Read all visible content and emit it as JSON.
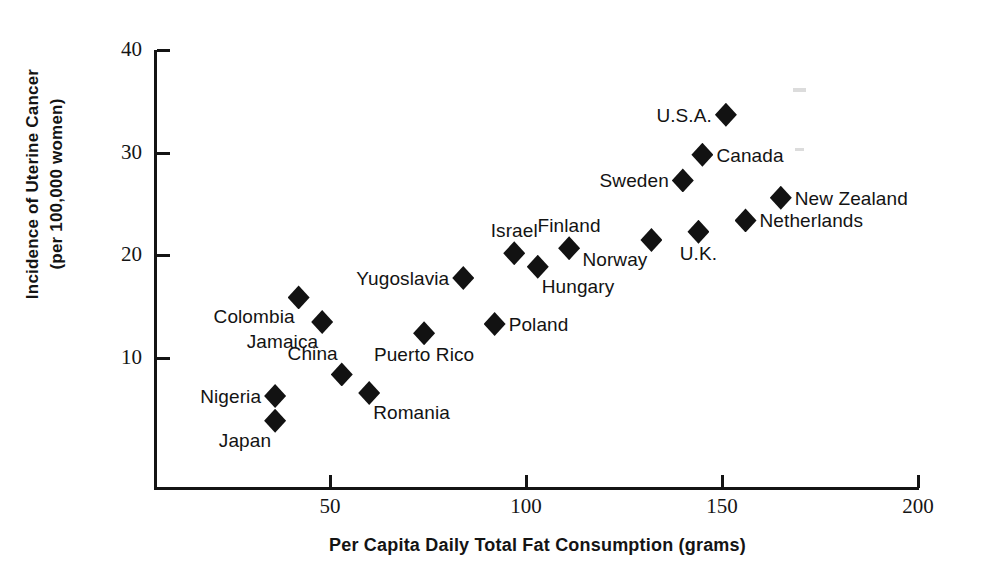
{
  "chart_data": {
    "type": "scatter",
    "title": "",
    "xlabel": "Per Capita Daily Total Fat Consumption (grams)",
    "ylabel_line1": "Incidence of Uterine Cancer",
    "ylabel_line2": "(per 100,000 women)",
    "xlim": [
      5,
      200
    ],
    "ylim": [
      0,
      40
    ],
    "xticks": [
      50,
      100,
      150,
      200
    ],
    "yticks": [
      10,
      20,
      30,
      40
    ],
    "xtick_labels": [
      "50",
      "100",
      "150",
      "200"
    ],
    "ytick_labels": [
      "10",
      "20",
      "30",
      "40"
    ],
    "grid": false,
    "legend": "none",
    "marker": "filled-diamond",
    "marker_color": "#121212",
    "points": [
      {
        "label": "U.S.A.",
        "x": 151,
        "y": 33.7,
        "label_pos": "left"
      },
      {
        "label": "Canada",
        "x": 145,
        "y": 29.8,
        "label_pos": "right"
      },
      {
        "label": "Sweden",
        "x": 140,
        "y": 27.3,
        "label_pos": "left"
      },
      {
        "label": "New Zealand",
        "x": 165,
        "y": 25.6,
        "label_pos": "right"
      },
      {
        "label": "Netherlands",
        "x": 156,
        "y": 23.4,
        "label_pos": "right"
      },
      {
        "label": "U.K.",
        "x": 144,
        "y": 22.3,
        "label_pos": "below"
      },
      {
        "label": "Norway",
        "x": 132,
        "y": 21.5,
        "label_pos": "below-left"
      },
      {
        "label": "Finland",
        "x": 111,
        "y": 20.7,
        "label_pos": "above"
      },
      {
        "label": "Israel",
        "x": 97,
        "y": 20.2,
        "label_pos": "above"
      },
      {
        "label": "Hungary",
        "x": 103,
        "y": 18.9,
        "label_pos": "below-right"
      },
      {
        "label": "Yugoslavia",
        "x": 84,
        "y": 17.8,
        "label_pos": "left"
      },
      {
        "label": "Colombia",
        "x": 42,
        "y": 15.9,
        "label_pos": "below-left"
      },
      {
        "label": "Jamaica",
        "x": 48,
        "y": 13.5,
        "label_pos": "below-left"
      },
      {
        "label": "Poland",
        "x": 92,
        "y": 13.3,
        "label_pos": "right"
      },
      {
        "label": "Puerto Rico",
        "x": 74,
        "y": 12.4,
        "label_pos": "below"
      },
      {
        "label": "China",
        "x": 53,
        "y": 8.4,
        "label_pos": "above-left"
      },
      {
        "label": "Romania",
        "x": 60,
        "y": 6.6,
        "label_pos": "below-right"
      },
      {
        "label": "Nigeria",
        "x": 36,
        "y": 6.3,
        "label_pos": "left"
      },
      {
        "label": "Japan",
        "x": 36,
        "y": 3.9,
        "label_pos": "below-left"
      }
    ]
  }
}
